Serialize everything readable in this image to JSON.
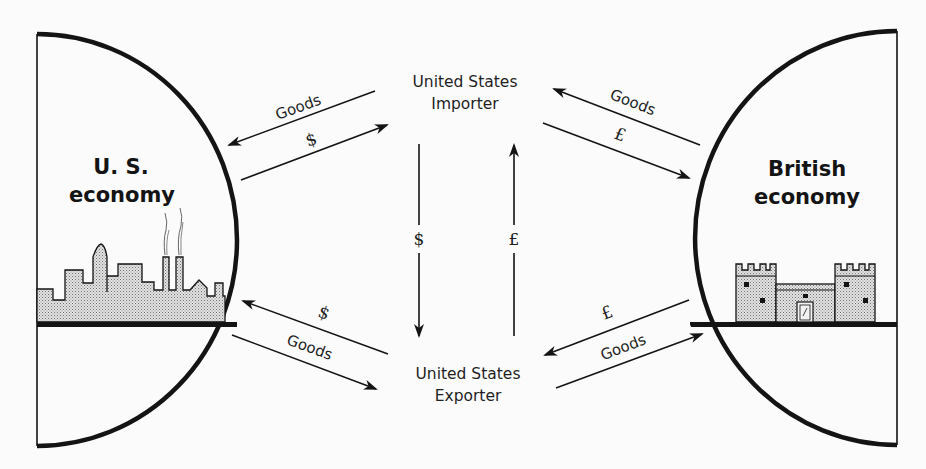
{
  "diagram": {
    "nodes": {
      "us_economy": {
        "line1": "U. S.",
        "line2": "economy"
      },
      "british_economy": {
        "line1": "British",
        "line2": "economy"
      },
      "importer": {
        "line1": "United States",
        "line2": "Importer"
      },
      "exporter": {
        "line1": "United States",
        "line2": "Exporter"
      }
    },
    "flows": {
      "importer_to_us_goods": {
        "label": "Goods",
        "from": "importer",
        "to": "us_economy"
      },
      "us_to_importer_dollars": {
        "label": "$",
        "from": "us_economy",
        "to": "importer"
      },
      "british_to_importer_goods": {
        "label": "Goods",
        "from": "british_economy",
        "to": "importer"
      },
      "importer_to_british_pounds": {
        "label": "£",
        "from": "importer",
        "to": "british_economy"
      },
      "importer_to_exporter_dollars": {
        "label": "$",
        "from": "importer",
        "to": "exporter"
      },
      "exporter_to_importer_pounds": {
        "label": "£",
        "from": "exporter",
        "to": "importer"
      },
      "exporter_to_us_dollars": {
        "label": "$",
        "from": "exporter",
        "to": "us_economy"
      },
      "us_to_exporter_goods": {
        "label": "Goods",
        "from": "us_economy",
        "to": "exporter"
      },
      "british_to_exporter_pounds": {
        "label": "£",
        "from": "british_economy",
        "to": "exporter"
      },
      "exporter_to_british_goods": {
        "label": "Goods",
        "from": "exporter",
        "to": "british_economy"
      }
    },
    "icons": {
      "us_skyline": "city-skyline-icon",
      "british_castle": "castle-icon"
    },
    "colors": {
      "ink": "#141414",
      "background": "#fbfbfb",
      "stipple": "#c9c9c9"
    }
  }
}
